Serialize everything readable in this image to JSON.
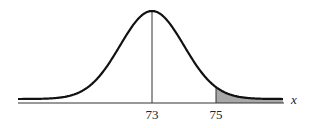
{
  "chart_data": {
    "type": "area",
    "title": "",
    "xlabel": "x",
    "ylabel": "",
    "mean": 73,
    "tick_labels": [
      "73",
      "75"
    ],
    "ticks": [
      73,
      75
    ],
    "shaded_region": {
      "from": 75,
      "to": "+inf",
      "color": "#a8a8a8"
    },
    "mean_line": true,
    "grid": false,
    "legend": null
  },
  "labels": {
    "mean": "73",
    "cutoff": "75",
    "x_axis": "x"
  },
  "colors": {
    "curve": "#111111",
    "shade": "#a8a8a8",
    "axis": "#333333"
  }
}
